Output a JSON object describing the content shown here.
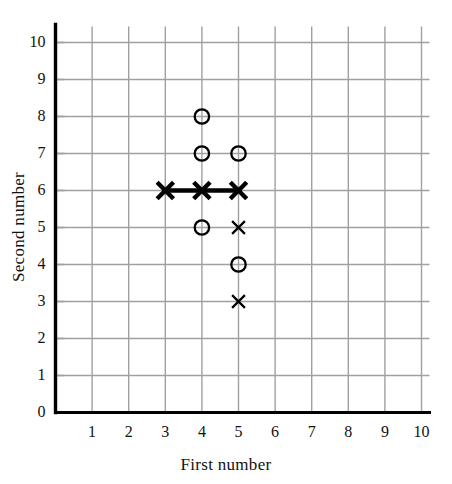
{
  "chart_data": {
    "type": "scatter",
    "title": "",
    "xlabel": "First number",
    "ylabel": "Second number",
    "xlim": [
      0,
      10
    ],
    "ylim": [
      0,
      10
    ],
    "xticks": [
      1,
      2,
      3,
      4,
      5,
      6,
      7,
      8,
      9,
      10
    ],
    "yticks": [
      0,
      1,
      2,
      3,
      4,
      5,
      6,
      7,
      8,
      9,
      10
    ],
    "xtick_labels": [
      "1",
      "2",
      "3",
      "4",
      "5",
      "6",
      "7",
      "8",
      "9",
      "10"
    ],
    "ytick_labels": [
      "0",
      "1",
      "2",
      "3",
      "4",
      "5",
      "6",
      "7",
      "8",
      "9",
      "10"
    ],
    "grid": true,
    "grid_color": "#a0a0a0",
    "axis_color": "#000000",
    "legend": "none",
    "series": [
      {
        "name": "circle-markers",
        "marker": "circle",
        "color": "#000000",
        "points": [
          {
            "x": 4,
            "y": 8
          },
          {
            "x": 4,
            "y": 7
          },
          {
            "x": 5,
            "y": 7
          },
          {
            "x": 4,
            "y": 5
          },
          {
            "x": 5,
            "y": 4
          }
        ]
      },
      {
        "name": "bold-x-markers-with-line",
        "marker": "x-bold",
        "color": "#000000",
        "connected": true,
        "points": [
          {
            "x": 3,
            "y": 6
          },
          {
            "x": 4,
            "y": 6
          },
          {
            "x": 5,
            "y": 6
          }
        ]
      },
      {
        "name": "thin-x-markers",
        "marker": "x-thin",
        "color": "#000000",
        "points": [
          {
            "x": 5,
            "y": 5
          },
          {
            "x": 5,
            "y": 3
          }
        ]
      }
    ]
  },
  "axes": {
    "x_title": "First number",
    "y_title": "Second number"
  }
}
